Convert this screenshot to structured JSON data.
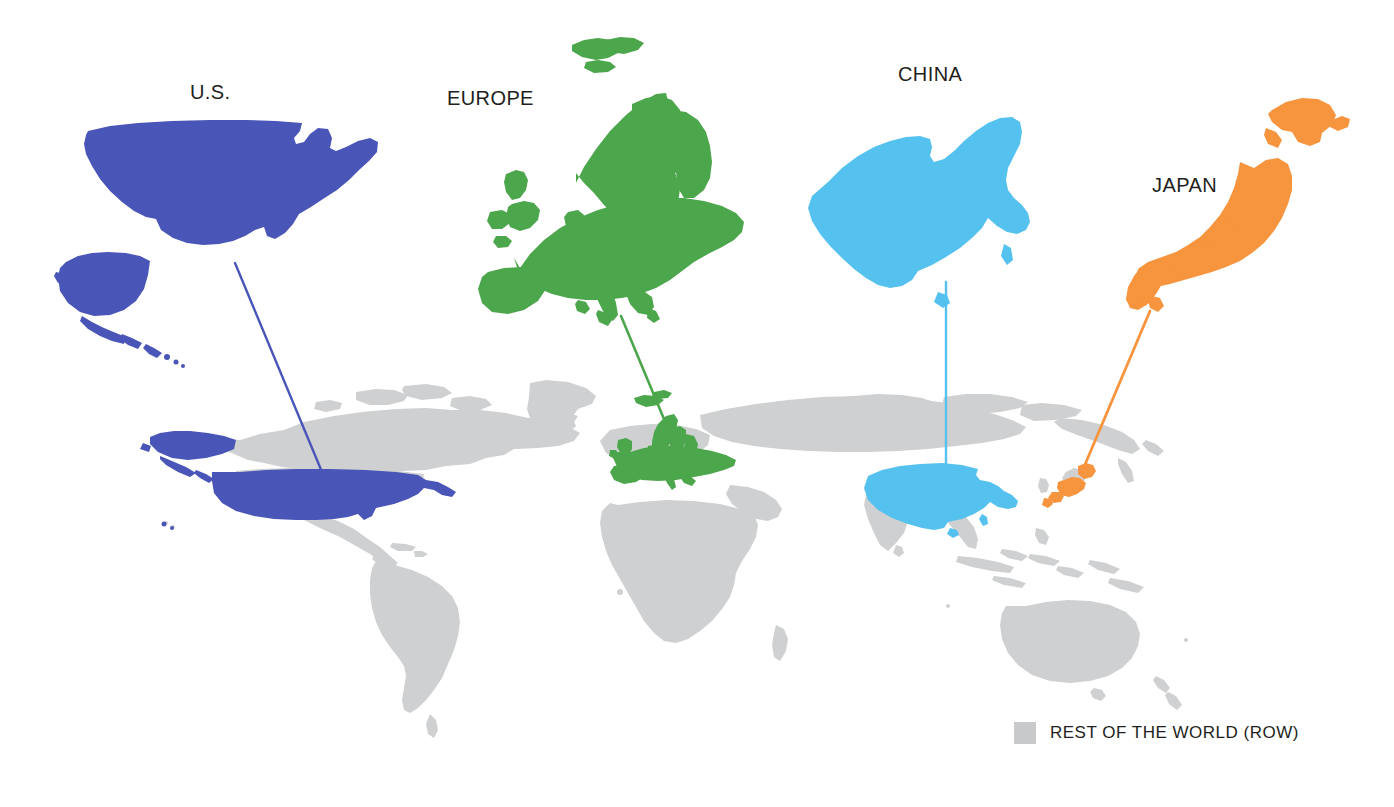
{
  "figure": {
    "type": "world-map-callout-diagram",
    "background_color": "#ffffff"
  },
  "regions": [
    {
      "key": "us",
      "label": "U.S.",
      "color": "#4a55b8",
      "callout_position": {
        "x": 190,
        "y": 82
      },
      "inset_map": "united-states-with-alaska-hawaii",
      "connector": {
        "from": [
          235,
          263
        ],
        "to": [
          322,
          472
        ]
      }
    },
    {
      "key": "europe",
      "label": "EUROPE",
      "color": "#4ca64c",
      "callout_position": {
        "x": 447,
        "y": 88
      },
      "inset_map": "europe",
      "connector": {
        "from": [
          621,
          316
        ],
        "to": [
          669,
          431
        ]
      }
    },
    {
      "key": "china",
      "label": "CHINA",
      "color": "#55c1ef",
      "callout_position": {
        "x": 898,
        "y": 64
      },
      "inset_map": "china",
      "connector": {
        "from": [
          946,
          282
        ],
        "to": [
          946,
          477
        ]
      }
    },
    {
      "key": "japan",
      "label": "JAPAN",
      "color": "#f7943e",
      "callout_position": {
        "x": 1152,
        "y": 175
      },
      "inset_map": "japan",
      "connector": {
        "from": [
          1150,
          311
        ],
        "to": [
          1081,
          474
        ]
      }
    }
  ],
  "legend": {
    "swatch_color": "#c8c9ca",
    "label": "REST OF THE WORLD (ROW)"
  },
  "world_map": {
    "base_color": "#cfd0d1",
    "highlight_regions": [
      "U.S.",
      "EUROPE",
      "CHINA",
      "JAPAN"
    ],
    "unhighlighted_label": "REST OF THE WORLD (ROW)"
  }
}
